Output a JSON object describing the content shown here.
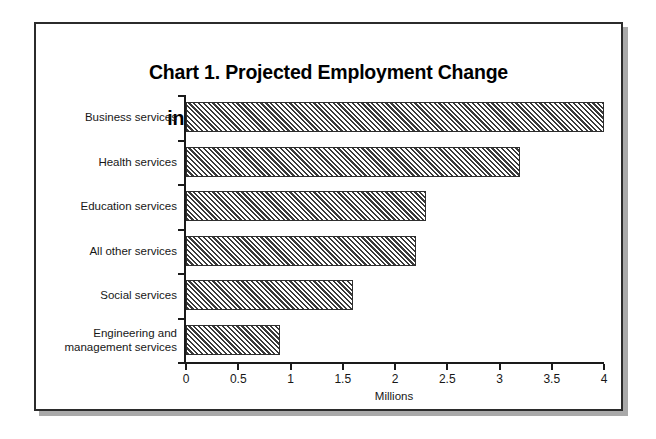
{
  "figure": {
    "title_line1": "Chart 1. Projected Employment Change",
    "title_line2": "in Services Industries through 2005",
    "frame_color": "#2b2b2b",
    "shadow_color": "#a9a9a9",
    "background": "#ffffff"
  },
  "chart_data": {
    "type": "bar",
    "orientation": "horizontal",
    "title": "Chart 1. Projected Employment Change in Services Industries through 2005",
    "categories": [
      "Business services",
      "Health services",
      "Education services",
      "All other services",
      "Social services",
      "Engineering and\nmanagement services"
    ],
    "values": [
      4.0,
      3.2,
      2.3,
      2.2,
      1.6,
      0.9
    ],
    "xlabel": "Millions",
    "ylabel": "",
    "xlim": [
      0,
      4
    ],
    "xticks": [
      0,
      0.5,
      1,
      1.5,
      2,
      2.5,
      3,
      3.5,
      4
    ],
    "xtick_labels": [
      "0",
      "0.5",
      "1",
      "1.5",
      "2",
      "2.5",
      "3",
      "3.5",
      "4"
    ],
    "grid": false,
    "legend": null,
    "bar_fill": "diagonal-hatch",
    "bar_fill_color": "#3a3a3a",
    "bar_edge_color": "#2e2e2e"
  }
}
